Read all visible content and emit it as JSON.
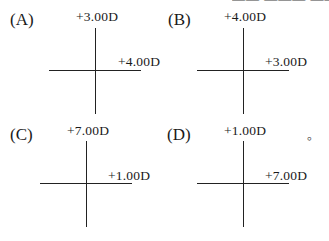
{
  "top_clipped_text": "—— ——— ——— —",
  "options": [
    {
      "label": "(A)",
      "vertical_power": "+3.00D",
      "horizontal_power": "+4.00D"
    },
    {
      "label": "(B)",
      "vertical_power": "+4.00D",
      "horizontal_power": "+3.00D"
    },
    {
      "label": "(C)",
      "vertical_power": "+7.00D",
      "horizontal_power": "+1.00D"
    },
    {
      "label": "(D)",
      "vertical_power": "+1.00D",
      "horizontal_power": "+7.00D"
    }
  ],
  "end_mark": "。",
  "colors": {
    "line": "#222222",
    "text": "#1a1a1a",
    "background": "#ffffff"
  }
}
